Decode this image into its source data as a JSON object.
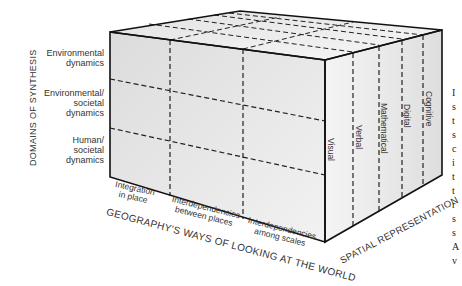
{
  "diagram": {
    "type": "3d-cube-matrix",
    "colors": {
      "edge": "#111111",
      "face_front": "#e6e6e6",
      "face_top": "#efefef",
      "face_right": "#e9e9e9",
      "text": "#333333"
    }
  },
  "axes": {
    "domains_title": "DOMAINS OF SYNTHESIS",
    "ways_title": "GEOGRAPHY'S WAYS OF LOOKING AT THE WORLD",
    "representation_title": "SPATIAL REPRESENTATION"
  },
  "domains": [
    {
      "line1": "Environmental",
      "line2": "dynamics",
      "line3": ""
    },
    {
      "line1": "Environmental/",
      "line2": "societal",
      "line3": "dynamics"
    },
    {
      "line1": "Human/",
      "line2": "societal",
      "line3": "dynamics"
    }
  ],
  "ways": [
    {
      "line1": "Integration",
      "line2": "in place"
    },
    {
      "line1": "Interdependencies",
      "line2": "between places"
    },
    {
      "line1": "Interdependencies",
      "line2": "among scales"
    }
  ],
  "representations": [
    "Visual",
    "Verbal",
    "Mathematical",
    "Digital",
    "Cognitive"
  ],
  "edge_text": [
    "I",
    "s",
    "t",
    "s",
    "c",
    "i",
    "t",
    "t",
    "r",
    "s",
    "s",
    "A",
    "v"
  ]
}
